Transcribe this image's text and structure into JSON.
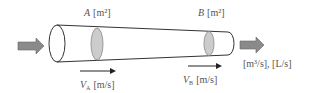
{
  "diagram": {
    "section_a": {
      "symbol": "A",
      "unit": "[m²]"
    },
    "section_b": {
      "symbol": "B",
      "unit": "[m²]"
    },
    "velocity_a": {
      "symbol": "V",
      "subscript": "A",
      "unit": "[m/s]"
    },
    "velocity_b": {
      "symbol": "V",
      "subscript": "B",
      "unit": "[m/s]"
    },
    "flow_rate_units": "[m³/s], [L/s]",
    "colors": {
      "outline": "#333333",
      "cross_section_fill": "#cccccc",
      "flow_arrow_fill": "#8a8a8a",
      "text": "#555555"
    }
  }
}
